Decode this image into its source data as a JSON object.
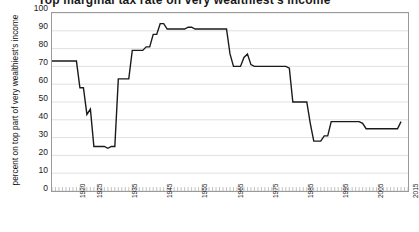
{
  "title": "Top marginal tax rate on very wealthiest's income",
  "axis": {
    "ylabel": "percent on top part of very wealthiest's income",
    "yticks": [
      "100",
      "90",
      "80",
      "70",
      "60",
      "50",
      "40",
      "30",
      "20",
      "10",
      "0"
    ],
    "xticklabels": [
      "1920",
      "1925",
      "1935",
      "1945",
      "1955",
      "1965",
      "1975",
      "1985",
      "1995",
      "2005",
      "2015"
    ]
  },
  "chart_data": {
    "type": "line",
    "title": "Top marginal tax rate on very wealthiest's income",
    "xlabel": "",
    "ylabel": "percent on top part of very wealthiest's income",
    "ylim": [
      0,
      100
    ],
    "xlim": [
      1913,
      2015
    ],
    "ytick_step": 10,
    "grid": true,
    "legend": "none",
    "line_color": "#1a1a1a",
    "gridline_color": "#d9d9d9",
    "series": [
      {
        "name": "top marginal rate",
        "x": [
          1913,
          1914,
          1915,
          1916,
          1917,
          1918,
          1919,
          1920,
          1921,
          1922,
          1923,
          1924,
          1925,
          1926,
          1927,
          1928,
          1929,
          1930,
          1931,
          1932,
          1933,
          1934,
          1935,
          1936,
          1937,
          1938,
          1939,
          1940,
          1941,
          1942,
          1943,
          1944,
          1945,
          1946,
          1947,
          1948,
          1949,
          1950,
          1951,
          1952,
          1953,
          1954,
          1955,
          1956,
          1957,
          1958,
          1959,
          1960,
          1961,
          1962,
          1963,
          1964,
          1965,
          1966,
          1967,
          1968,
          1969,
          1970,
          1971,
          1972,
          1973,
          1974,
          1975,
          1976,
          1977,
          1978,
          1979,
          1980,
          1981,
          1982,
          1983,
          1984,
          1985,
          1986,
          1987,
          1988,
          1989,
          1990,
          1991,
          1992,
          1993,
          1994,
          1995,
          1996,
          1997,
          1998,
          1999,
          2000,
          2001,
          2002,
          2003,
          2004,
          2005,
          2006,
          2007,
          2008,
          2009,
          2010,
          2011,
          2012,
          2013
        ],
        "values": [
          73,
          73,
          73,
          73,
          73,
          73,
          73,
          73,
          58,
          58,
          43,
          46,
          25,
          25,
          25,
          25,
          24,
          25,
          25,
          63,
          63,
          63,
          63,
          79,
          79,
          79,
          79,
          81,
          81,
          88,
          88,
          94,
          94,
          91,
          91,
          91,
          91,
          91,
          91,
          92,
          92,
          91,
          91,
          91,
          91,
          91,
          91,
          91,
          91,
          91,
          91,
          77,
          70,
          70,
          70,
          75,
          77,
          71,
          70,
          70,
          70,
          70,
          70,
          70,
          70,
          70,
          70,
          70,
          69,
          50,
          50,
          50,
          50,
          50,
          38,
          28,
          28,
          28,
          31,
          31,
          39,
          39,
          39,
          39,
          39,
          39,
          39,
          39,
          39,
          38,
          35,
          35,
          35,
          35,
          35,
          35,
          35,
          35,
          35,
          35,
          39
        ]
      }
    ]
  }
}
